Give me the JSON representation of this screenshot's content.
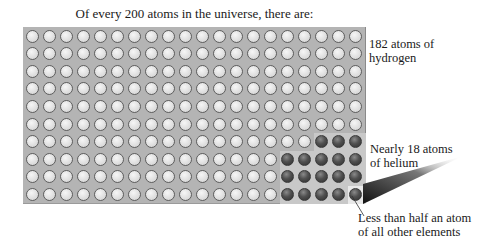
{
  "title": "Of every 200 atoms in the universe, there are:",
  "grid": {
    "columns": 20,
    "rows": 10,
    "total": 200
  },
  "labels": {
    "hydrogen": "182 atoms of hydrogen",
    "helium_line1": "Nearly 18 atoms",
    "helium_line2": "of helium",
    "other_line1": "Less than half an atom",
    "other_line2": "of all other elements"
  },
  "counts": {
    "hydrogen": 182,
    "helium": 18,
    "other": "<0.5"
  },
  "colors": {
    "background_grid": "#b4b4b4",
    "hydrogen_atom": "#dedede",
    "helium_atom": "#404040"
  }
}
